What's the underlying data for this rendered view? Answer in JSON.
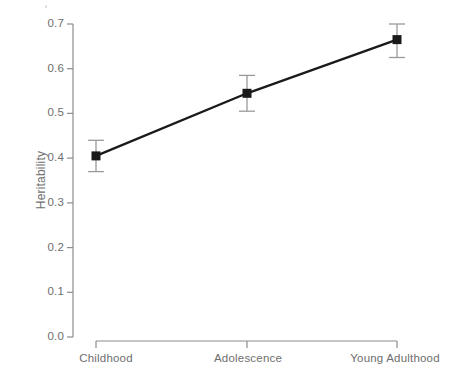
{
  "chart_data": {
    "type": "line",
    "title": "",
    "subtitle": "",
    "xlabel": "",
    "ylabel": "Heritability",
    "categories": [
      "Childhood",
      "Adolescence",
      "Young Adulthood"
    ],
    "values": [
      0.405,
      0.545,
      0.665
    ],
    "errors_upper": [
      0.44,
      0.585,
      0.7
    ],
    "errors_lower": [
      0.37,
      0.505,
      0.625
    ],
    "ylim": [
      0.0,
      0.7
    ],
    "ytick_labels": [
      "0.0",
      "0.1",
      "0.2",
      "0.3",
      "0.4",
      "0.5",
      "0.6",
      "0.7"
    ],
    "ytick_values": [
      0.0,
      0.1,
      0.2,
      0.3,
      0.4,
      0.5,
      0.6,
      0.7
    ],
    "grid": false,
    "legend": "none",
    "marker": "square",
    "series_name": "Heritability",
    "colors": {
      "line": "#1a1a1a",
      "marker": "#1a1a1a",
      "errorbar": "#9a9a9a",
      "axis": "#8c8c8c",
      "text": "#6e6e6e",
      "background": "#ffffff"
    }
  }
}
